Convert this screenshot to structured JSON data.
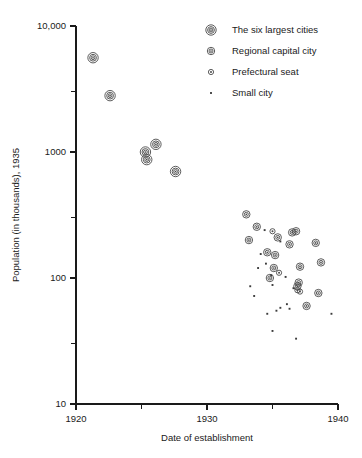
{
  "chart_data": {
    "type": "scatter",
    "title": "",
    "xlabel": "Date of establishment",
    "ylabel": "Population (in thousands), 1935",
    "xlim": [
      1920,
      1940
    ],
    "ylim": [
      10,
      10000
    ],
    "yscale": "log",
    "xscale": "linear",
    "grid": false,
    "legend_position": "top-right",
    "x_ticks": [
      {
        "value": 1920,
        "label": "1920",
        "major": true
      },
      {
        "value": 1925,
        "label": "",
        "major": false
      },
      {
        "value": 1930,
        "label": "1930",
        "major": true
      },
      {
        "value": 1935,
        "label": "",
        "major": false
      },
      {
        "value": 1940,
        "label": "1940",
        "major": true
      }
    ],
    "y_ticks": [
      {
        "value": 10000,
        "label": "10,000",
        "major": true
      },
      {
        "value": 3000,
        "label": "",
        "major": false
      },
      {
        "value": 1000,
        "label": "1000",
        "major": true
      },
      {
        "value": 300,
        "label": "",
        "major": false
      },
      {
        "value": 100,
        "label": "100",
        "major": true
      },
      {
        "value": 30,
        "label": "",
        "major": false
      },
      {
        "value": 10,
        "label": "10",
        "major": true
      }
    ],
    "series": [
      {
        "name": "The six largest cities",
        "marker": "triple-ring-circle",
        "points": [
          {
            "x": 1921.3,
            "y": 5600
          },
          {
            "x": 1922.6,
            "y": 2800
          },
          {
            "x": 1925.3,
            "y": 1000
          },
          {
            "x": 1925.4,
            "y": 870
          },
          {
            "x": 1926.1,
            "y": 1150
          },
          {
            "x": 1927.6,
            "y": 700
          }
        ]
      },
      {
        "name": "Regional capital city",
        "marker": "double-ring-circle",
        "points": [
          {
            "x": 1933.0,
            "y": 320
          },
          {
            "x": 1933.8,
            "y": 255
          },
          {
            "x": 1933.2,
            "y": 200
          },
          {
            "x": 1934.6,
            "y": 160
          },
          {
            "x": 1935.2,
            "y": 152
          },
          {
            "x": 1935.4,
            "y": 210
          },
          {
            "x": 1936.5,
            "y": 230
          },
          {
            "x": 1936.8,
            "y": 235
          },
          {
            "x": 1936.3,
            "y": 185
          },
          {
            "x": 1938.3,
            "y": 190
          },
          {
            "x": 1935.1,
            "y": 120
          },
          {
            "x": 1934.8,
            "y": 100
          },
          {
            "x": 1937.1,
            "y": 123
          },
          {
            "x": 1937.0,
            "y": 92
          },
          {
            "x": 1936.9,
            "y": 86
          },
          {
            "x": 1938.7,
            "y": 133
          },
          {
            "x": 1938.5,
            "y": 76
          },
          {
            "x": 1937.6,
            "y": 60
          }
        ]
      },
      {
        "name": "Prefectural seat",
        "marker": "ring-circle",
        "points": [
          {
            "x": 1935.0,
            "y": 235
          },
          {
            "x": 1935.5,
            "y": 110
          },
          {
            "x": 1936.9,
            "y": 80
          },
          {
            "x": 1937.1,
            "y": 78
          }
        ]
      },
      {
        "name": "Small city",
        "marker": "dot",
        "points": [
          {
            "x": 1934.4,
            "y": 240
          },
          {
            "x": 1934.1,
            "y": 155
          },
          {
            "x": 1935.6,
            "y": 195
          },
          {
            "x": 1934.5,
            "y": 130
          },
          {
            "x": 1933.9,
            "y": 120
          },
          {
            "x": 1934.9,
            "y": 105
          },
          {
            "x": 1936.0,
            "y": 102
          },
          {
            "x": 1935.0,
            "y": 88
          },
          {
            "x": 1936.6,
            "y": 83
          },
          {
            "x": 1936.1,
            "y": 62
          },
          {
            "x": 1935.6,
            "y": 58
          },
          {
            "x": 1935.3,
            "y": 55
          },
          {
            "x": 1936.3,
            "y": 57
          },
          {
            "x": 1934.6,
            "y": 52
          },
          {
            "x": 1939.5,
            "y": 52
          },
          {
            "x": 1933.6,
            "y": 72
          },
          {
            "x": 1935.0,
            "y": 38
          },
          {
            "x": 1936.8,
            "y": 33
          },
          {
            "x": 1933.3,
            "y": 86
          }
        ]
      }
    ]
  },
  "legend": {
    "items": [
      {
        "label": "The six largest cities",
        "marker": "triple-ring-circle"
      },
      {
        "label": "Regional capital city",
        "marker": "double-ring-circle"
      },
      {
        "label": "Prefectural seat",
        "marker": "ring-circle"
      },
      {
        "label": "Small city",
        "marker": "dot"
      }
    ]
  }
}
